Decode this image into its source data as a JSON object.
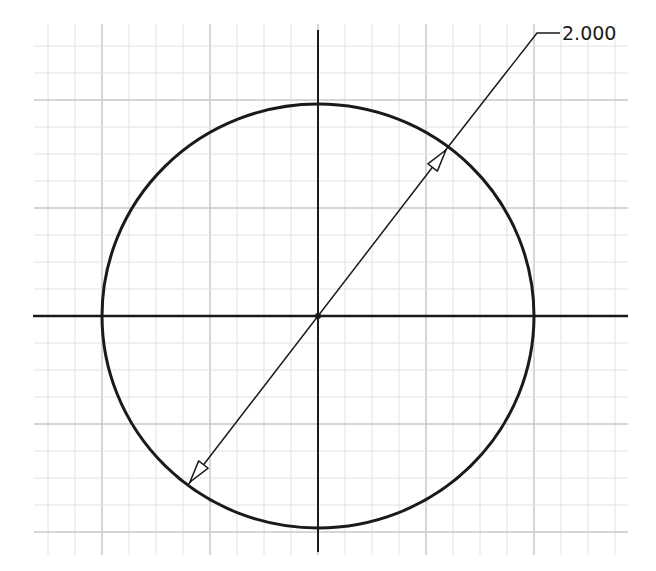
{
  "sketch": {
    "type": "CAD sketch",
    "grid": {
      "minor_spacing_px": 27,
      "major_every": 4,
      "x_min": 34,
      "x_max": 628,
      "y_min": 24,
      "y_max": 555,
      "minor_color": "#e2e2e2",
      "major_color": "#c8c8c8"
    },
    "axes": {
      "origin": {
        "x": 318,
        "y": 316
      },
      "horizontal": {
        "x1": 33,
        "x2": 628,
        "y": 316
      },
      "vertical": {
        "x": 318,
        "y1": 30,
        "y2": 552
      },
      "color": "#1a1a1a"
    },
    "circle": {
      "cx": 318,
      "cy": 316,
      "rx": 216,
      "ry": 212,
      "stroke": "#1a1a1a",
      "stroke_width": 3
    },
    "dimension": {
      "kind": "diameter",
      "value_label": "2.000",
      "line": {
        "x1": 188,
        "y1": 485,
        "x2": 448,
        "y2": 147
      },
      "leader": {
        "x1": 448,
        "y1": 147,
        "x2": 537,
        "y2": 33,
        "x3": 560,
        "y3": 33
      },
      "arrowheads": [
        {
          "tip_x": 190,
          "tip_y": 482,
          "direction": "to-start"
        },
        {
          "tip_x": 446,
          "tip_y": 150,
          "direction": "to-end"
        }
      ],
      "text_position": {
        "x": 562,
        "y": 24
      }
    }
  }
}
